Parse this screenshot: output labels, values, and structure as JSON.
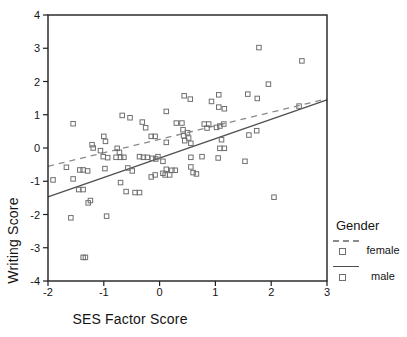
{
  "figure": {
    "background": "#ffffff",
    "frame_color": "#1f1f1f",
    "text_color": "#141414"
  },
  "chart_data": {
    "type": "scatter",
    "title": "",
    "xlabel": "SES Factor Score",
    "ylabel": "Writing Score",
    "xlim": [
      -2,
      3
    ],
    "ylim": [
      -4,
      4
    ],
    "xticks": [
      -2,
      -1,
      0,
      1,
      2,
      3
    ],
    "yticks": [
      -4,
      -3,
      -2,
      -1,
      0,
      1,
      2,
      3,
      4
    ],
    "grid": false,
    "marker": {
      "shape": "open-square",
      "size_px": 4.5,
      "color": "#6f6f6f"
    },
    "points": [
      [
        1.78,
        3.02
      ],
      [
        2.55,
        2.62
      ],
      [
        1.95,
        1.92
      ],
      [
        0.44,
        1.57
      ],
      [
        0.55,
        1.47
      ],
      [
        0.93,
        1.4
      ],
      [
        1.06,
        1.6
      ],
      [
        1.58,
        1.62
      ],
      [
        1.75,
        1.49
      ],
      [
        2.5,
        1.26
      ],
      [
        1.06,
        1.23
      ],
      [
        1.16,
        1.18
      ],
      [
        0.12,
        1.1
      ],
      [
        -1.55,
        0.73
      ],
      [
        -0.67,
        0.98
      ],
      [
        -0.53,
        0.91
      ],
      [
        -0.31,
        0.78
      ],
      [
        -0.25,
        0.61
      ],
      [
        0.3,
        0.75
      ],
      [
        0.4,
        0.75
      ],
      [
        0.8,
        0.72
      ],
      [
        0.88,
        0.72
      ],
      [
        0.85,
        0.6
      ],
      [
        1.02,
        0.62
      ],
      [
        1.08,
        0.66
      ],
      [
        1.15,
        0.72
      ],
      [
        1.6,
        0.39
      ],
      [
        1.74,
        0.52
      ],
      [
        0.42,
        0.55
      ],
      [
        0.5,
        0.46
      ],
      [
        0.43,
        0.37
      ],
      [
        0.52,
        0.3
      ],
      [
        0.45,
        0.22
      ],
      [
        0.56,
        0.14
      ],
      [
        -1.0,
        0.35
      ],
      [
        -0.97,
        0.2
      ],
      [
        -0.15,
        0.35
      ],
      [
        -0.08,
        0.35
      ],
      [
        0.12,
        0.17
      ],
      [
        1.11,
        0.25
      ],
      [
        -1.21,
        0.1
      ],
      [
        -1.19,
        0.0
      ],
      [
        -1.06,
        -0.08
      ],
      [
        -0.76,
        -0.01
      ],
      [
        -0.72,
        -0.13
      ],
      [
        1.08,
        -0.01
      ],
      [
        1.16,
        -0.01
      ],
      [
        -1.01,
        -0.26
      ],
      [
        -0.93,
        -0.29
      ],
      [
        -0.78,
        -0.28
      ],
      [
        -0.7,
        -0.28
      ],
      [
        -0.64,
        -0.28
      ],
      [
        -0.36,
        -0.26
      ],
      [
        -0.29,
        -0.28
      ],
      [
        -0.22,
        -0.28
      ],
      [
        -0.13,
        -0.31
      ],
      [
        -0.07,
        -0.33
      ],
      [
        -0.03,
        -0.26
      ],
      [
        0.06,
        -0.4
      ],
      [
        0.56,
        -0.28
      ],
      [
        0.76,
        -0.26
      ],
      [
        1.05,
        -0.3
      ],
      [
        1.53,
        -0.4
      ],
      [
        -1.67,
        -0.58
      ],
      [
        -1.43,
        -0.66
      ],
      [
        -1.37,
        -0.66
      ],
      [
        -1.29,
        -0.69
      ],
      [
        -0.98,
        -0.62
      ],
      [
        -0.57,
        -0.6
      ],
      [
        -0.49,
        -0.69
      ],
      [
        0.12,
        -0.64
      ],
      [
        0.22,
        -0.67
      ],
      [
        0.28,
        -0.67
      ],
      [
        0.56,
        -0.57
      ],
      [
        0.6,
        -0.74
      ],
      [
        0.66,
        -0.78
      ],
      [
        -1.91,
        -0.96
      ],
      [
        -1.55,
        -0.93
      ],
      [
        -0.7,
        -1.04
      ],
      [
        -0.15,
        -0.87
      ],
      [
        -0.08,
        -0.81
      ],
      [
        0.06,
        -0.76
      ],
      [
        0.1,
        -0.81
      ],
      [
        0.18,
        -0.81
      ],
      [
        -1.45,
        -1.25
      ],
      [
        -1.37,
        -1.25
      ],
      [
        -0.6,
        -1.31
      ],
      [
        -0.44,
        -1.34
      ],
      [
        -0.36,
        -1.34
      ],
      [
        -1.28,
        -1.65
      ],
      [
        -1.24,
        -1.58
      ],
      [
        -1.59,
        -2.1
      ],
      [
        -0.95,
        -2.05
      ],
      [
        -1.37,
        -3.29
      ],
      [
        -1.33,
        -3.29
      ],
      [
        2.05,
        -1.48
      ]
    ],
    "fit_lines": [
      {
        "series": "female",
        "style": "dashed",
        "color": "#8a8a8a",
        "from": [
          -2,
          -0.55
        ],
        "to": [
          3,
          1.48
        ]
      },
      {
        "series": "male",
        "style": "solid",
        "color": "#4f4f4f",
        "from": [
          -2,
          -1.47
        ],
        "to": [
          3,
          1.45
        ]
      }
    ],
    "legend": {
      "title": "Gender",
      "position": "right-bottom",
      "entries": [
        {
          "label": "female",
          "line_style": "dashed",
          "marker": "open-square"
        },
        {
          "label": "male",
          "line_style": "solid",
          "marker": "open-square"
        }
      ]
    }
  }
}
